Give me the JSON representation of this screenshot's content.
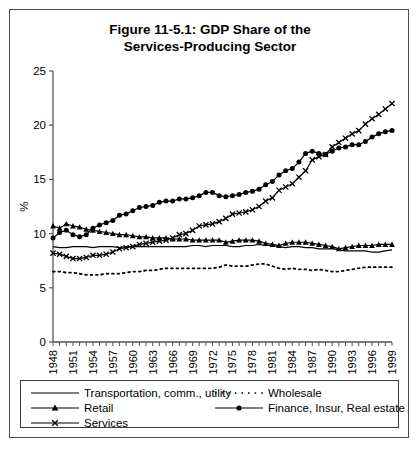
{
  "figure": {
    "title_line1": "Figure 11-5.1: GDP Share of the",
    "title_line2": "Services-Producing Sector"
  },
  "chart_data": {
    "type": "line",
    "title": "Figure 11-5.1: GDP Share of the Services-Producing Sector",
    "xlabel": "",
    "ylabel": "%",
    "ylim": [
      0,
      25
    ],
    "yticks": [
      0,
      5,
      10,
      15,
      20,
      25
    ],
    "ytick_labels": [
      "0",
      "5",
      "10",
      "15",
      "20",
      "25"
    ],
    "xlim": [
      1948,
      1999
    ],
    "xtick_labels": [
      "1948",
      "1951",
      "1954",
      "1957",
      "1960",
      "1963",
      "1966",
      "1969",
      "1972",
      "1975",
      "1978",
      "1981",
      "1984",
      "1987",
      "1990",
      "1993",
      "1996",
      "1999"
    ],
    "x": [
      1948,
      1949,
      1950,
      1951,
      1952,
      1953,
      1954,
      1955,
      1956,
      1957,
      1958,
      1959,
      1960,
      1961,
      1962,
      1963,
      1964,
      1965,
      1966,
      1967,
      1968,
      1969,
      1970,
      1971,
      1972,
      1973,
      1974,
      1975,
      1976,
      1977,
      1978,
      1979,
      1980,
      1981,
      1982,
      1983,
      1984,
      1985,
      1986,
      1987,
      1988,
      1989,
      1990,
      1991,
      1992,
      1993,
      1994,
      1995,
      1996,
      1997,
      1998,
      1999
    ],
    "grid": false,
    "legend_position": "below-plot",
    "series": [
      {
        "name": "Transportation, comm., utility",
        "marker": "none",
        "linestyle": "solid",
        "color": "#000000",
        "values": [
          8.8,
          8.7,
          8.7,
          8.8,
          8.8,
          8.8,
          8.7,
          8.8,
          8.8,
          8.8,
          8.7,
          8.8,
          8.8,
          8.8,
          8.8,
          8.8,
          8.8,
          8.8,
          8.8,
          8.8,
          8.8,
          8.9,
          8.9,
          8.8,
          8.9,
          8.9,
          8.9,
          8.8,
          8.8,
          8.9,
          8.9,
          9.0,
          8.9,
          8.9,
          8.8,
          8.7,
          8.8,
          8.8,
          8.7,
          8.7,
          8.6,
          8.6,
          8.6,
          8.5,
          8.4,
          8.4,
          8.4,
          8.4,
          8.3,
          8.3,
          8.4,
          8.5
        ]
      },
      {
        "name": "Wholesale",
        "marker": "none",
        "linestyle": "dotted",
        "color": "#000000",
        "values": [
          6.5,
          6.5,
          6.4,
          6.4,
          6.3,
          6.2,
          6.2,
          6.2,
          6.3,
          6.3,
          6.3,
          6.4,
          6.5,
          6.5,
          6.6,
          6.6,
          6.7,
          6.8,
          6.8,
          6.8,
          6.8,
          6.8,
          6.8,
          6.8,
          6.8,
          6.9,
          7.1,
          7.0,
          7.0,
          7.0,
          7.1,
          7.2,
          7.2,
          7.0,
          6.8,
          6.7,
          6.8,
          6.7,
          6.7,
          6.6,
          6.7,
          6.6,
          6.5,
          6.5,
          6.6,
          6.7,
          6.8,
          6.9,
          6.9,
          6.9,
          6.9,
          6.9
        ]
      },
      {
        "name": "Retail",
        "marker": "triangle",
        "linestyle": "solid",
        "color": "#000000",
        "values": [
          10.7,
          10.5,
          10.9,
          10.7,
          10.6,
          10.4,
          10.3,
          10.2,
          10.1,
          10.0,
          9.9,
          9.9,
          9.8,
          9.7,
          9.7,
          9.6,
          9.6,
          9.6,
          9.5,
          9.5,
          9.5,
          9.4,
          9.4,
          9.4,
          9.4,
          9.4,
          9.2,
          9.3,
          9.4,
          9.4,
          9.4,
          9.3,
          9.1,
          9.0,
          8.9,
          9.1,
          9.2,
          9.2,
          9.2,
          9.1,
          9.0,
          8.9,
          8.8,
          8.6,
          8.7,
          8.8,
          8.9,
          8.9,
          8.9,
          9.0,
          9.0,
          9.0
        ]
      },
      {
        "name": "Finance, Insur, Real estate",
        "marker": "circle",
        "linestyle": "solid",
        "color": "#000000",
        "values": [
          9.6,
          10.1,
          10.3,
          9.9,
          9.7,
          9.9,
          10.5,
          10.8,
          11.0,
          11.2,
          11.7,
          11.8,
          12.1,
          12.4,
          12.5,
          12.6,
          12.9,
          13.0,
          13.0,
          13.2,
          13.2,
          13.3,
          13.5,
          13.8,
          13.8,
          13.5,
          13.4,
          13.5,
          13.6,
          13.8,
          13.9,
          14.1,
          14.5,
          14.8,
          15.4,
          15.8,
          16.0,
          16.6,
          17.4,
          17.6,
          17.4,
          17.3,
          17.6,
          17.9,
          18.0,
          18.2,
          18.2,
          18.5,
          18.9,
          19.2,
          19.4,
          19.5
        ]
      },
      {
        "name": "Services",
        "marker": "x",
        "linestyle": "solid",
        "color": "#000000",
        "values": [
          8.2,
          8.1,
          7.9,
          7.7,
          7.7,
          7.8,
          8.0,
          8.0,
          8.1,
          8.3,
          8.6,
          8.7,
          8.8,
          9.0,
          9.1,
          9.2,
          9.3,
          9.4,
          9.6,
          9.9,
          10.0,
          10.3,
          10.7,
          10.8,
          10.9,
          11.1,
          11.4,
          11.8,
          11.9,
          12.0,
          12.2,
          12.5,
          13.0,
          13.3,
          14.0,
          14.3,
          14.6,
          15.2,
          15.8,
          16.8,
          17.1,
          17.3,
          18.0,
          18.4,
          18.8,
          19.2,
          19.5,
          20.1,
          20.6,
          21.0,
          21.5,
          22.0
        ]
      }
    ]
  },
  "legend": {
    "items": [
      {
        "label": "Transportation, comm., utility",
        "marker": "none",
        "linestyle": "solid"
      },
      {
        "label": "Wholesale",
        "marker": "none",
        "linestyle": "dotted"
      },
      {
        "label": "Retail",
        "marker": "triangle",
        "linestyle": "solid"
      },
      {
        "label": "Finance, Insur, Real estate",
        "marker": "circle",
        "linestyle": "solid"
      },
      {
        "label": "Services",
        "marker": "x",
        "linestyle": "solid"
      }
    ]
  }
}
